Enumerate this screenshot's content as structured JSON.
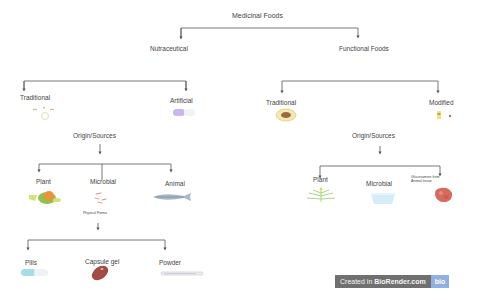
{
  "diagram": {
    "root": {
      "label": "Medicinal Foods"
    },
    "nutraceutical": {
      "label": "Nutraceutical",
      "traditional": {
        "label": "Traditional",
        "icon": "herb-leaves-icon"
      },
      "artificial": {
        "label": "Artificial",
        "icon": "capsule-pill-icon"
      },
      "origin": {
        "label": "Origin/Sources",
        "children": [
          {
            "label": "Plant",
            "icon": "plant-fruit-icon"
          },
          {
            "label": "Microbial",
            "icon": "bacteria-icon"
          },
          {
            "label": "Animal",
            "icon": "fish-icon"
          }
        ],
        "physical_forms": {
          "label": "Physical Forms",
          "children": [
            {
              "label": "Pills",
              "icon": "pill-capsule-icon"
            },
            {
              "label": "Capsule gel",
              "icon": "gel-capsule-icon"
            },
            {
              "label": "Powder",
              "icon": "powder-spatula-icon"
            }
          ]
        }
      }
    },
    "functional": {
      "label": "Functional Foods",
      "traditional": {
        "label": "Traditional",
        "icon": "avocado-icon"
      },
      "modified": {
        "label": "Modified",
        "icon": "bottle-icon"
      },
      "origin": {
        "label": "Origin/Sources",
        "children": [
          {
            "label": "Plant",
            "icon": "plant-sprout-icon"
          },
          {
            "label": "Microbial",
            "icon": "petri-dish-icon"
          },
          {
            "label": "Glucosamine from Animal tissue",
            "line1": "Glucosamine from",
            "line2": "Animal tissue",
            "icon": "tissue-icon"
          }
        ]
      }
    }
  },
  "watermark": {
    "prefix": "Created in",
    "brand": "BioRender.com",
    "logo": "bio"
  },
  "colors": {
    "line": "#555555",
    "text": "#444444",
    "badge_bg": "#707070",
    "badge_logo": "#8fb0e0"
  }
}
